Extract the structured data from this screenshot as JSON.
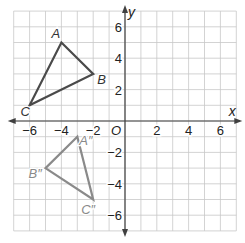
{
  "diagram": {
    "type": "coordinate-plane",
    "x_range": [
      -7,
      7
    ],
    "y_range": [
      -7,
      7
    ],
    "grid_step": 1,
    "axis_labels": {
      "x": "x",
      "y": "y",
      "origin": "O"
    },
    "x_ticks": [
      {
        "value": -6,
        "label": "−6"
      },
      {
        "value": -4,
        "label": "−4"
      },
      {
        "value": -2,
        "label": "−2"
      },
      {
        "value": 2,
        "label": "2"
      },
      {
        "value": 4,
        "label": "4"
      },
      {
        "value": 6,
        "label": "6"
      }
    ],
    "y_ticks": [
      {
        "value": 6,
        "label": "6"
      },
      {
        "value": 4,
        "label": "4"
      },
      {
        "value": 2,
        "label": "2"
      },
      {
        "value": -2,
        "label": "−2"
      },
      {
        "value": -4,
        "label": "−4"
      },
      {
        "value": -6,
        "label": "−6"
      }
    ],
    "colors": {
      "grid": "#c8c8c8",
      "axis": "#404040",
      "triangle_original": "#4a4a4a",
      "triangle_image": "#8a8a8a",
      "label_original": "#333333",
      "label_image": "#8a8a8a"
    },
    "triangles": [
      {
        "name": "ABC",
        "vertices": [
          {
            "label": "A",
            "x": -4,
            "y": 5,
            "dx": -10,
            "dy": -5
          },
          {
            "label": "B",
            "x": -2,
            "y": 3,
            "dx": 4,
            "dy": 10
          },
          {
            "label": "C",
            "x": -6,
            "y": 1,
            "dx": -9,
            "dy": 11
          }
        ]
      },
      {
        "name": "A″B″C″",
        "vertices": [
          {
            "label": "A″",
            "x": -3,
            "y": -1,
            "dx": 2,
            "dy": 8
          },
          {
            "label": "B″",
            "x": -5,
            "y": -3,
            "dx": -17,
            "dy": 10
          },
          {
            "label": "C″",
            "x": -2,
            "y": -5,
            "dx": -12,
            "dy": 14
          }
        ]
      }
    ]
  }
}
